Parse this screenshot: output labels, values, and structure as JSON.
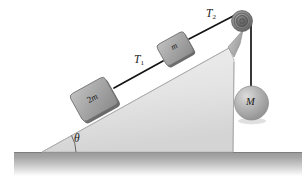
{
  "figure": {
    "background_color": "#ffffff"
  },
  "labels": {
    "tension_upper": "T",
    "tension_upper_sub": "2",
    "tension_lower": "T",
    "tension_lower_sub": "1",
    "angle": "θ",
    "hanging_mass": "M",
    "block_upper": "m",
    "block_lower_coefficient": "2",
    "block_lower_mass": "m"
  },
  "colors": {
    "incline_fill": "#e3e3e3",
    "incline_edge": "#b9b9b9",
    "ground_dark": "#9b9b9b",
    "ground_light": "#d8d8d8",
    "block_face": "#a8a8a8",
    "block_edge": "#6f6f6f",
    "sphere_fill": "#b0b0b0",
    "sphere_highlight": "#d5d5d5",
    "pulley_outer": "#7d7d7d",
    "pulley_inner": "#5a5a5a",
    "rope": "#141414",
    "text": "#1a1a1a"
  },
  "geometry": {
    "incline_angle_degrees": 29,
    "incline_apex": [
      42,
      152
    ],
    "incline_top": [
      230,
      48
    ],
    "incline_base_right": [
      233,
      152
    ],
    "ground_line_y": 152,
    "pulley_center": [
      242,
      21
    ],
    "pulley_radius": 10,
    "sphere_center": [
      251,
      103
    ],
    "sphere_radius": 17,
    "block_m_center": [
      176,
      50
    ],
    "block_m_side": 28,
    "block_2m_center": [
      96,
      101
    ],
    "block_2m_side": 34,
    "rope_vertical_x": 251
  },
  "elements": {
    "incline_name": "inclined-plane",
    "ground_name": "ground-surface",
    "rope_lower_name": "rope-segment-T1",
    "rope_upper_name": "rope-segment-T2",
    "rope_vertical_name": "rope-segment-vertical",
    "pulley_name": "pulley",
    "sphere_name": "hanging-mass-sphere",
    "angle_arc_name": "angle-arc"
  }
}
